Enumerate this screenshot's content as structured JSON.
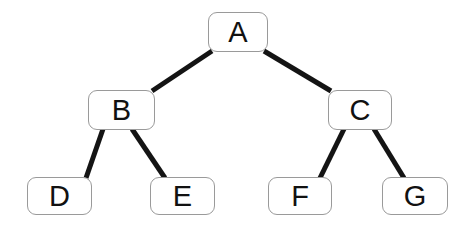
{
  "diagram": {
    "background_color": "#ffffff",
    "node_fill_color": "#ffffff",
    "node_border_color": "#9a9a9a",
    "edge_color": "#141414",
    "label_color": "#111111",
    "edge_width": 5
  },
  "nodes": [
    {
      "id": "A",
      "label": "A",
      "level": 0,
      "x": 208,
      "y": 12,
      "w": 60,
      "h": 40
    },
    {
      "id": "B",
      "label": "B",
      "level": 1,
      "x": 88,
      "y": 90,
      "w": 67,
      "h": 40
    },
    {
      "id": "C",
      "label": "C",
      "level": 1,
      "x": 328,
      "y": 90,
      "w": 64,
      "h": 40
    },
    {
      "id": "D",
      "label": "D",
      "level": 2,
      "x": 27,
      "y": 177,
      "w": 65,
      "h": 38
    },
    {
      "id": "E",
      "label": "E",
      "level": 2,
      "x": 150,
      "y": 177,
      "w": 65,
      "h": 38
    },
    {
      "id": "F",
      "label": "F",
      "level": 2,
      "x": 268,
      "y": 177,
      "w": 64,
      "h": 38
    },
    {
      "id": "G",
      "label": "G",
      "level": 2,
      "x": 382,
      "y": 177,
      "w": 66,
      "h": 38
    }
  ],
  "edges": [
    {
      "id": "A-B",
      "from": "A",
      "to": "B",
      "x1": 212,
      "y1": 51,
      "x2": 152,
      "y2": 91
    },
    {
      "id": "A-C",
      "from": "A",
      "to": "C",
      "x1": 264,
      "y1": 51,
      "x2": 331,
      "y2": 91
    },
    {
      "id": "B-D",
      "from": "B",
      "to": "D",
      "x1": 103,
      "y1": 129,
      "x2": 86,
      "y2": 178
    },
    {
      "id": "B-E",
      "from": "B",
      "to": "E",
      "x1": 132,
      "y1": 129,
      "x2": 165,
      "y2": 178
    },
    {
      "id": "C-F",
      "from": "C",
      "to": "F",
      "x1": 344,
      "y1": 129,
      "x2": 320,
      "y2": 178
    },
    {
      "id": "C-G",
      "from": "C",
      "to": "G",
      "x1": 374,
      "y1": 129,
      "x2": 404,
      "y2": 178
    }
  ]
}
